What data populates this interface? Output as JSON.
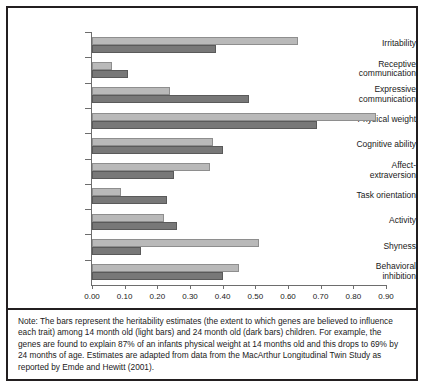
{
  "chart_data": {
    "type": "bar",
    "orientation": "horizontal",
    "title": "",
    "subtitle": "",
    "xlabel": "",
    "ylabel": "",
    "xlim": [
      0.0,
      0.9
    ],
    "xticks": [
      "0.00",
      "0.10",
      "0.20",
      "0.30",
      "0.40",
      "0.50",
      "0.60",
      "0.70",
      "0.80",
      "0.90"
    ],
    "xtick_values": [
      0.0,
      0.1,
      0.2,
      0.3,
      0.4,
      0.5,
      0.6,
      0.7,
      0.8,
      0.9
    ],
    "grid": false,
    "legend_position": "none",
    "categories": [
      "Irritability",
      "Receptive\ncommunication",
      "Expressive\ncommunication",
      "Physical weight",
      "Cognitive ability",
      "Affect-\nextraversion",
      "Task orientation",
      "Activity",
      "Shyness",
      "Behavioral\ninhibition"
    ],
    "series": [
      {
        "name": "14 month old (light bars)",
        "color": "#b9b9b9",
        "values": [
          0.63,
          0.06,
          0.24,
          0.87,
          0.37,
          0.36,
          0.09,
          0.22,
          0.51,
          0.45
        ]
      },
      {
        "name": "24 month old (dark bars)",
        "color": "#787878",
        "values": [
          0.38,
          0.11,
          0.48,
          0.69,
          0.4,
          0.25,
          0.23,
          0.26,
          0.15,
          0.4
        ]
      }
    ]
  },
  "note": {
    "text": "Note: The bars represent the heritability estimates (the extent to which genes are believed to influence each trait) among 14 month old (light bars) and 24 month old (dark bars) children. For example, the genes are found to explain 87% of an infants physical weight at 14 months old and this drops to 69% by 24 months of age. Estimates are adapted from data from the MacArthur Longitudinal Twin Study as reported by Emde and Hewitt (2001)."
  }
}
